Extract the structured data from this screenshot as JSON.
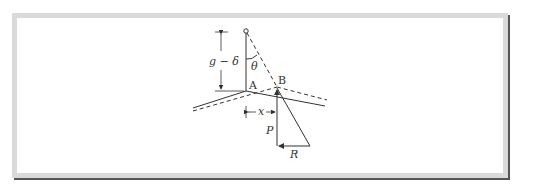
{
  "figure": {
    "labels": {
      "g_minus_delta": "g − δ",
      "theta": "θ",
      "point_a": "A",
      "point_b": "B",
      "x": "x",
      "p": "P",
      "r": "R"
    },
    "colors": {
      "line": "#333333",
      "frame_border": "#dadada",
      "frame_shadow": "#555555",
      "background": "#ffffff"
    }
  }
}
